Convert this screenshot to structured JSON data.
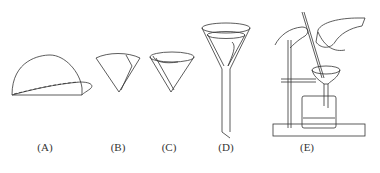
{
  "figure": {
    "panels": [
      {
        "id": "A",
        "label": "(A)",
        "depicts": "filter paper folded in half"
      },
      {
        "id": "B",
        "label": "(B)",
        "depicts": "filter paper folded into quarter cone"
      },
      {
        "id": "C",
        "label": "(C)",
        "depicts": "filter paper opened into cone"
      },
      {
        "id": "D",
        "label": "(D)",
        "depicts": "filter paper placed in funnel"
      },
      {
        "id": "E",
        "label": "(E)",
        "depicts": "filtration with glass rod, stand, funnel and beaker"
      }
    ]
  },
  "colors": {
    "line": "#333333",
    "background": "#ffffff"
  }
}
